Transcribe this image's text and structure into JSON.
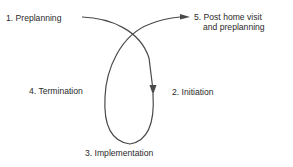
{
  "diagram": {
    "type": "process-cycle",
    "stroke_color": "#4a4a4a",
    "text_color": "#2a2a2a",
    "stages": [
      {
        "number": "1.",
        "label": "Preplanning"
      },
      {
        "number": "2.",
        "label": "Initiation"
      },
      {
        "number": "3.",
        "label": "Implementation"
      },
      {
        "number": "4.",
        "label": "Termination"
      },
      {
        "number": "5.",
        "label_line1": "Post home visit",
        "label_line2": "and preplanning"
      }
    ],
    "labels": {
      "stage1": "1.  Preplanning",
      "stage2": "2.  Initiation",
      "stage3": "3.  Implementation",
      "stage4": "4.  Termination",
      "stage5_line1": "5.  Post home visit",
      "stage5_line2": "and preplanning"
    },
    "connections": [
      {
        "from": "1. Preplanning",
        "to": "2. Initiation",
        "arrow": "end"
      },
      {
        "from": "2. Initiation",
        "to": "3. Implementation",
        "arrow": "none"
      },
      {
        "from": "3. Implementation",
        "to": "4. Termination",
        "arrow": "none"
      },
      {
        "from": "4. Termination",
        "to": "5. Post home visit and preplanning",
        "arrow": "end"
      }
    ]
  }
}
